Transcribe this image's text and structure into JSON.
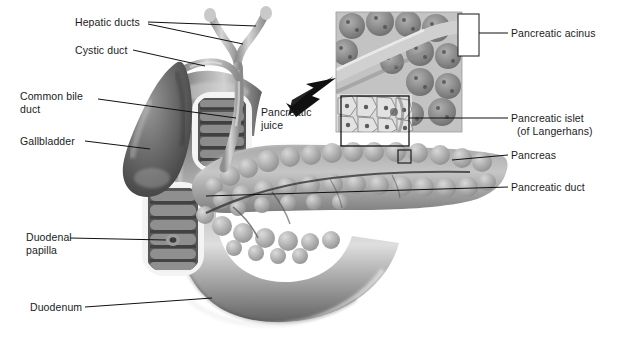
{
  "figure": {
    "kind": "anatomical-illustration",
    "background_color": "#ffffff",
    "label_color": "#1b1b1b",
    "leader_line_color": "#111111"
  },
  "labels": [
    {
      "id": "hepatic-ducts",
      "text": "Hepatic ducts",
      "x": 75,
      "y": 22,
      "align": "right"
    },
    {
      "id": "cystic-duct",
      "text": "Cystic duct",
      "x": 75,
      "y": 50,
      "align": "right"
    },
    {
      "id": "common-bile-duct",
      "line1": "Common bile",
      "line2": "duct",
      "x": 20,
      "y": 96,
      "align": "left"
    },
    {
      "id": "gallbladder",
      "text": "Gallbladder",
      "x": 20,
      "y": 137,
      "align": "left"
    },
    {
      "id": "duodenal-papilla",
      "line1": "Duodenal",
      "line2": "papilla",
      "x": 26,
      "y": 232,
      "align": "left"
    },
    {
      "id": "duodenum",
      "text": "Duodenum",
      "x": 30,
      "y": 303,
      "align": "left"
    },
    {
      "id": "pancreatic-juice",
      "line1": "Pancreatic",
      "line2": "juice",
      "x": 261,
      "y": 107,
      "align": "left"
    },
    {
      "id": "pancreatic-acinus",
      "text": "Pancreatic acinus",
      "x": 511,
      "y": 28,
      "align": "left"
    },
    {
      "id": "pancreatic-islet",
      "line1": "Pancreatic islet",
      "line2": "(of Langerhans)",
      "x": 511,
      "y": 112,
      "align": "left"
    },
    {
      "id": "pancreas",
      "text": "Pancreas",
      "x": 511,
      "y": 150,
      "align": "left"
    },
    {
      "id": "pancreatic-duct",
      "text": "Pancreatic duct",
      "x": 511,
      "y": 181,
      "align": "left"
    }
  ],
  "structures": [
    {
      "id": "hepatic-ducts-tree",
      "name": "hepatic duct bifurcation"
    },
    {
      "id": "common-bile-duct-tube",
      "name": "common bile duct"
    },
    {
      "id": "cystic-duct-tube",
      "name": "cystic duct"
    },
    {
      "id": "gallbladder-body",
      "name": "gallbladder"
    },
    {
      "id": "duodenum-loop",
      "name": "duodenum C-loop"
    },
    {
      "id": "duodenum-window-upper",
      "name": "upper cut-away duodenal window"
    },
    {
      "id": "duodenum-window-lower",
      "name": "lower cut-away duodenal window"
    },
    {
      "id": "duodenal-papilla-point",
      "name": "duodenal papilla opening"
    },
    {
      "id": "pancreas-body",
      "name": "pancreas with lobules"
    },
    {
      "id": "pancreatic-duct-line",
      "name": "pancreatic duct inside pancreas"
    },
    {
      "id": "acinus-inset",
      "name": "pancreatic acinus histology inset"
    },
    {
      "id": "islet-inset",
      "name": "pancreatic islet histology inset"
    },
    {
      "id": "magnify-marker",
      "name": "magnified-region square marker"
    },
    {
      "id": "juice-arrow",
      "name": "pancreatic juice flow arrow"
    },
    {
      "id": "acinus-bracket",
      "name": "acinus callout bracket box"
    }
  ]
}
